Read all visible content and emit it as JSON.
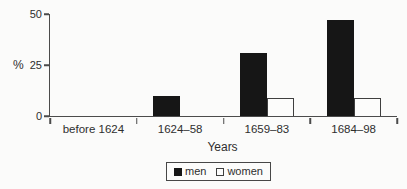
{
  "chart_data": {
    "type": "bar",
    "categories": [
      "before 1624",
      "1624–58",
      "1659–83",
      "1684–98"
    ],
    "series": [
      {
        "name": "men",
        "values": [
          0,
          10,
          31,
          47
        ],
        "fill": "#161616"
      },
      {
        "name": "women",
        "values": [
          0,
          0,
          9,
          9
        ],
        "fill": "#fcfcfb"
      }
    ],
    "xlabel": "Years",
    "ylabel": "%",
    "yticks": [
      0,
      25,
      50
    ],
    "ylim": [
      0,
      50
    ],
    "grid": false,
    "legend_position": "bottom",
    "axis_color": "#4b4b4b"
  }
}
